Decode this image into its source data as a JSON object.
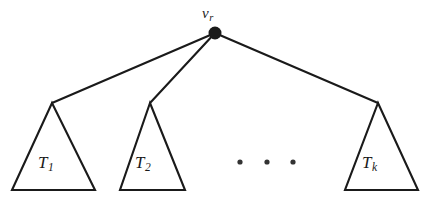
{
  "figure": {
    "kind": "rooted-tree-diagram",
    "width": 428,
    "height": 206,
    "background_color": "#ffffff",
    "stroke_color": "#1a1a1a",
    "text_color": "#1a1a1a"
  },
  "root_node": {
    "name": "root-vertex",
    "label_base": "v",
    "label_subscript": "r",
    "center_x": 215,
    "center_y": 33,
    "radius": 6.5,
    "fill_color": "#1a1a1a",
    "label_x": 202,
    "label_y": 5
  },
  "edges": [
    {
      "name": "edge-root-to-T1",
      "x1": 215,
      "y1": 33,
      "x2": 52,
      "y2": 103
    },
    {
      "name": "edge-root-to-T2",
      "x1": 215,
      "y1": 33,
      "x2": 150,
      "y2": 103
    },
    {
      "name": "edge-root-to-Tk",
      "x1": 215,
      "y1": 33,
      "x2": 378,
      "y2": 103
    }
  ],
  "subtrees": [
    {
      "name": "subtree-T1",
      "label_base": "T",
      "label_subscript": "1",
      "apex_x": 52,
      "apex_y": 103,
      "base_left_x": 12,
      "base_right_x": 95,
      "base_y": 190,
      "label_x": 38,
      "label_y": 153
    },
    {
      "name": "subtree-T2",
      "label_base": "T",
      "label_subscript": "2",
      "apex_x": 150,
      "apex_y": 103,
      "base_left_x": 120,
      "base_right_x": 185,
      "base_y": 190,
      "label_x": 135,
      "label_y": 153
    },
    {
      "name": "subtree-Tk",
      "label_base": "T",
      "label_subscript": "k",
      "apex_x": 378,
      "apex_y": 103,
      "base_left_x": 345,
      "base_right_x": 418,
      "base_y": 190,
      "label_x": 362,
      "label_y": 153
    }
  ],
  "ellipsis": {
    "name": "ellipsis-between-subtrees",
    "text": "· · ·",
    "dot_radius": 2.6,
    "dot_y": 162,
    "dots_x": [
      240,
      267,
      293
    ],
    "color": "#333333"
  }
}
